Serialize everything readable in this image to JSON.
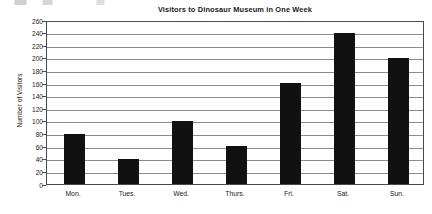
{
  "chart_data": {
    "type": "bar",
    "title": "Visitors to Dinosaur Museum in One Week",
    "xlabel": "",
    "ylabel": "Number of Visitors",
    "categories": [
      "Mon.",
      "Tues.",
      "Wed.",
      "Thurs.",
      "Fri.",
      "Sat.",
      "Sun."
    ],
    "values": [
      80,
      40,
      100,
      60,
      160,
      240,
      200
    ],
    "series": [
      {
        "name": "Visitors",
        "values": [
          80,
          40,
          100,
          60,
          160,
          240,
          200
        ]
      }
    ],
    "ylim": [
      0,
      260
    ],
    "ytick_step": 20,
    "yticks": [
      0,
      20,
      40,
      60,
      80,
      100,
      120,
      140,
      160,
      180,
      200,
      220,
      240,
      260
    ],
    "ytick_labels": [
      "0",
      "20",
      "40",
      "60",
      "80",
      "100",
      "120",
      "140",
      "160",
      "180",
      "200",
      "220",
      "240",
      "260"
    ],
    "grid": true,
    "grid_axis": "y",
    "legend": false,
    "legend_position": "none",
    "bar_color": "#111111",
    "gridline_color": "#8c8c8c",
    "axis_color": "#4a4a4a",
    "background_color": "#ffffff"
  }
}
